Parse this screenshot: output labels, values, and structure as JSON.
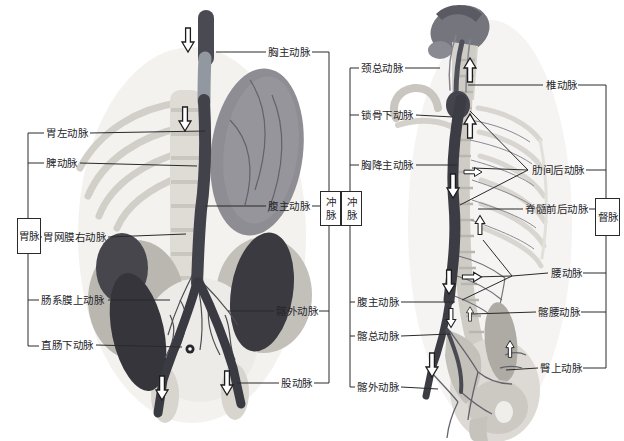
{
  "diagram": {
    "title_implicit": "arterial anatomy with meridian correspondences",
    "colors": {
      "background": "#ffffff",
      "line": "#2a2a2a",
      "text": "#26262a",
      "vessel_dark": "#42424a",
      "bone_light": "#d8d5cf",
      "organ_gray": "#8d8d93"
    },
    "icons": {
      "flow_arrow": "hollow-directional-arrow"
    },
    "left_figure": {
      "labels_left": [
        "胃左动脉",
        "脾动脉",
        "胃网膜右动脉",
        "肠系膜上动脉",
        "直肠下动脉"
      ],
      "labels_right": [
        "胸主动脉",
        "腹主动脉",
        "髂外动脉",
        "股动脉"
      ],
      "meridian_box_left": "胃脉",
      "meridian_box_right": "冲脉"
    },
    "right_figure": {
      "labels_left": [
        "颈总动脉",
        "锁骨下动脉",
        "胸降主动脉",
        "腹主动脉",
        "髂总动脉",
        "髂外动脉"
      ],
      "labels_right": [
        "椎动脉",
        "肋间后动脉",
        "脊髓前后动脉",
        "腰动脉",
        "髂腰动脉",
        "臀上动脉"
      ],
      "meridian_box_left": "冲脉",
      "meridian_box_right": "督脉"
    }
  }
}
